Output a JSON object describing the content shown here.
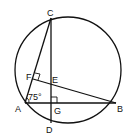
{
  "diagram": {
    "type": "geometry",
    "circle": {
      "cx": 68,
      "cy": 70,
      "r": 53
    },
    "points": {
      "C": {
        "x": 51,
        "y": 18,
        "label": "C"
      },
      "A": {
        "x": 25,
        "y": 102,
        "label": "A"
      },
      "B": {
        "x": 116,
        "y": 103,
        "label": "B"
      },
      "D": {
        "x": 51,
        "y": 123,
        "label": "D"
      },
      "G": {
        "x": 51,
        "y": 103,
        "label": "G"
      },
      "E": {
        "x": 51,
        "y": 82,
        "label": "E"
      },
      "F": {
        "x": 33,
        "y": 79,
        "label": "F"
      }
    },
    "angle_label": "75°",
    "labels": {
      "C": "C",
      "A": "A",
      "B": "B",
      "D": "D",
      "G": "G",
      "E": "E",
      "F": "F"
    }
  }
}
